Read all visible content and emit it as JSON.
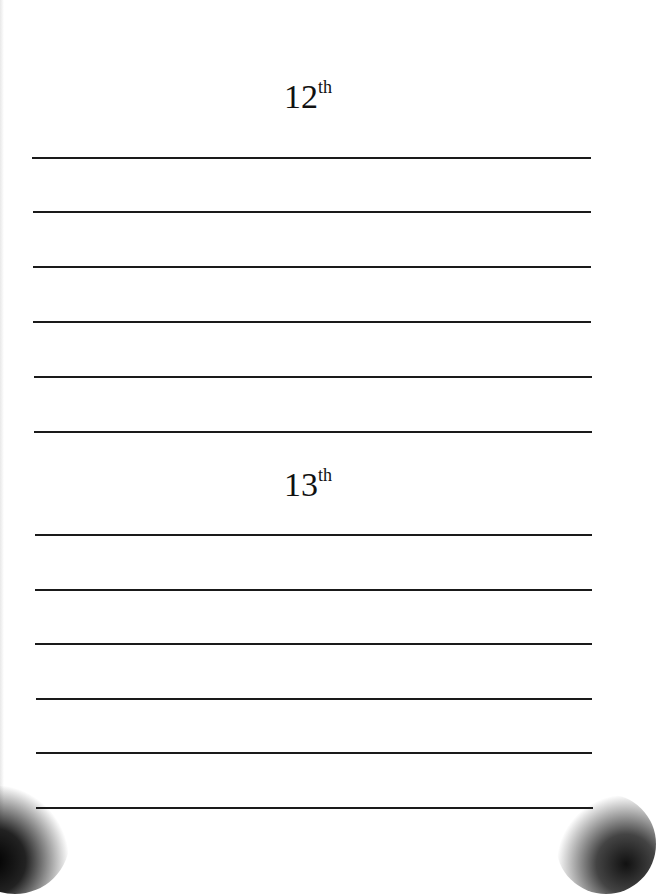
{
  "sections": [
    {
      "day": "12",
      "suffix": "th",
      "line_count": 6
    },
    {
      "day": "13",
      "suffix": "th",
      "line_count": 6
    }
  ],
  "colors": {
    "background": "#ffffff",
    "rule": "#1a1a1a",
    "text": "#111111"
  }
}
